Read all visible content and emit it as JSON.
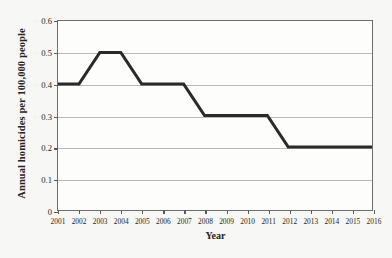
{
  "chart_data": {
    "type": "line",
    "title": "",
    "xlabel": "Year",
    "ylabel": "Annual homicides per 100,000 people",
    "categories": [
      "2001",
      "2002",
      "2003",
      "2004",
      "2005",
      "2006",
      "2007",
      "2008",
      "2009",
      "2010",
      "2011",
      "2012",
      "2013",
      "2014",
      "2015",
      "2016"
    ],
    "values": [
      0.4,
      0.4,
      0.5,
      0.5,
      0.4,
      0.4,
      0.4,
      0.3,
      0.3,
      0.3,
      0.3,
      0.2,
      0.2,
      0.2,
      0.2,
      0.2
    ],
    "series": [
      {
        "name": "Annual homicides per 100,000 people",
        "values": [
          0.4,
          0.4,
          0.5,
          0.5,
          0.4,
          0.4,
          0.4,
          0.3,
          0.3,
          0.3,
          0.3,
          0.2,
          0.2,
          0.2,
          0.2,
          0.2
        ]
      }
    ],
    "xlim": [
      2001,
      2016
    ],
    "ylim": [
      0,
      0.6
    ],
    "ytick_labels": [
      "0",
      "0.1",
      "0.2",
      "0.3",
      "0.4",
      "0.5",
      "0.6"
    ],
    "ytick_values": [
      0,
      0.1,
      0.2,
      0.3,
      0.4,
      0.5,
      0.6
    ],
    "xtick_labels": [
      "2001",
      "2002",
      "2003",
      "2004",
      "2005",
      "2006",
      "2007",
      "2008",
      "2009",
      "2010",
      "2011",
      "2012",
      "2013",
      "2014",
      "2015",
      "2016"
    ],
    "grid": "horizontal",
    "legend": "none",
    "line_color": "#2a2a28",
    "grid_color": "#b9b9b6",
    "frame_color": "#6d6d6a",
    "plot_background": "#fdfdfc",
    "page_background": "#f7f7f5"
  }
}
